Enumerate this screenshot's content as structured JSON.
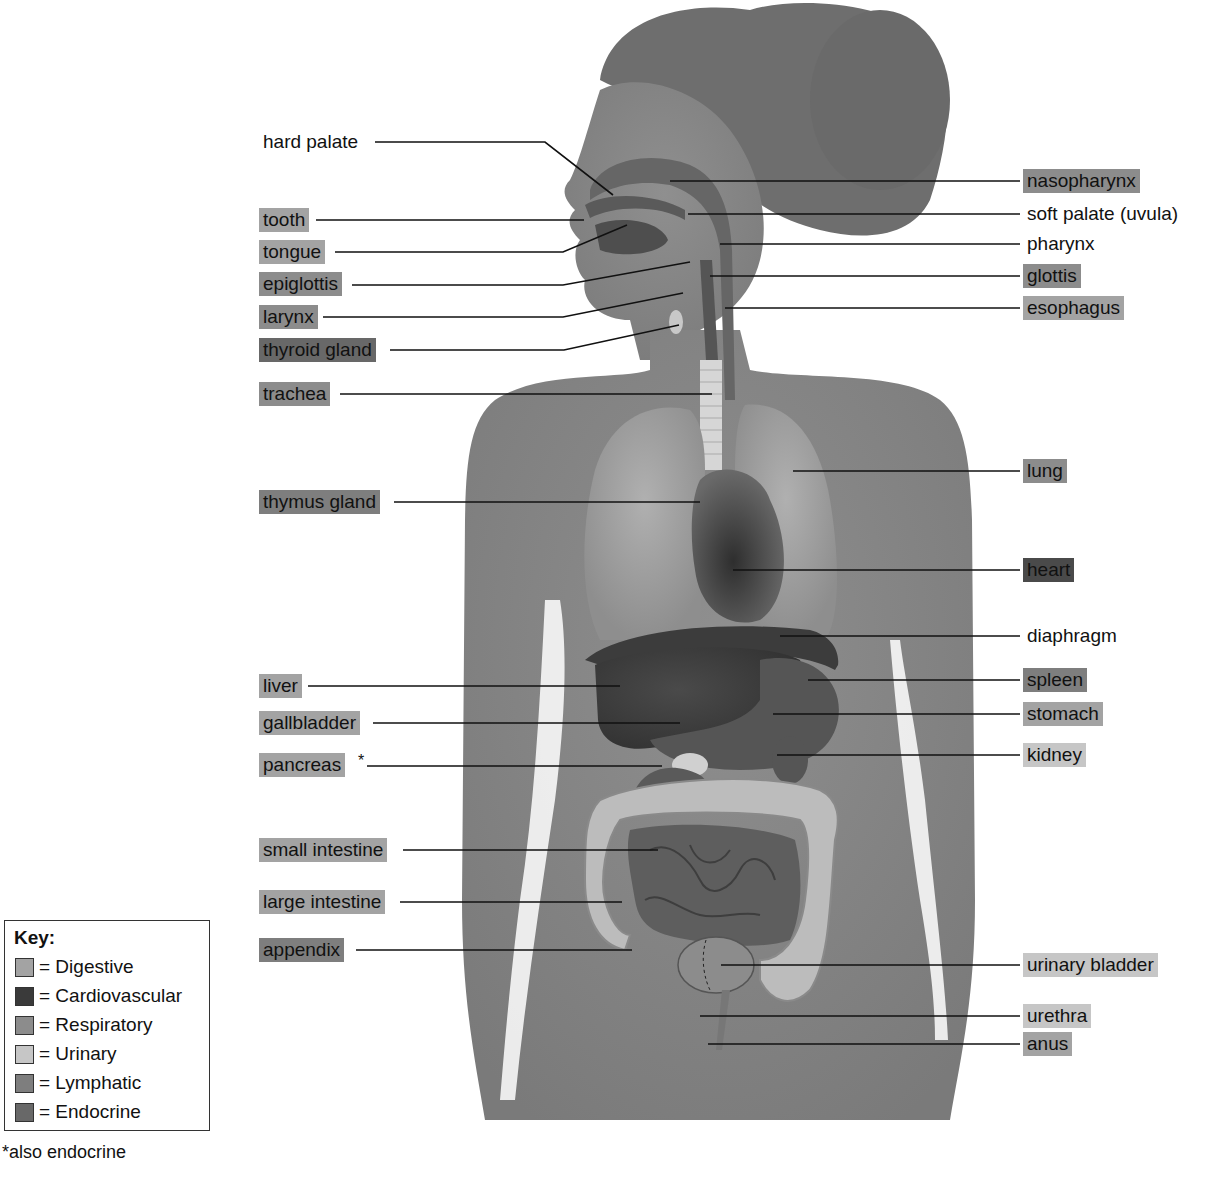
{
  "key": {
    "title": "Key:",
    "items": [
      {
        "label": "= Digestive",
        "system": "digestive",
        "color": "#a3a3a3"
      },
      {
        "label": "= Cardiovascular",
        "system": "cardiovascular",
        "color": "#3a3a3a"
      },
      {
        "label": "= Respiratory",
        "system": "respiratory",
        "color": "#8c8c8c"
      },
      {
        "label": "= Urinary",
        "system": "urinary",
        "color": "#c6c6c6"
      },
      {
        "label": "= Lymphatic",
        "system": "lymphatic",
        "color": "#7e7e7e"
      },
      {
        "label": "= Endocrine",
        "system": "endocrine",
        "color": "#686868"
      }
    ]
  },
  "footnote": "*also endocrine",
  "labels_left": [
    {
      "text": "hard palate",
      "system": "none"
    },
    {
      "text": "tooth",
      "system": "digestive"
    },
    {
      "text": "tongue",
      "system": "digestive"
    },
    {
      "text": "epiglottis",
      "system": "respiratory"
    },
    {
      "text": "larynx",
      "system": "respiratory"
    },
    {
      "text": "thyroid gland",
      "system": "endocrine"
    },
    {
      "text": "trachea",
      "system": "respiratory"
    },
    {
      "text": "thymus gland",
      "system": "lymphatic"
    },
    {
      "text": "liver",
      "system": "digestive"
    },
    {
      "text": "gallbladder",
      "system": "digestive"
    },
    {
      "text": "pancreas",
      "system": "digestive",
      "marker": "*"
    },
    {
      "text": "small intestine",
      "system": "digestive"
    },
    {
      "text": "large intestine",
      "system": "digestive"
    },
    {
      "text": "appendix",
      "system": "lymphatic"
    }
  ],
  "labels_right": [
    {
      "text": "nasopharynx",
      "system": "respiratory"
    },
    {
      "text": "soft palate (uvula)",
      "system": "none"
    },
    {
      "text": "pharynx",
      "system": "none"
    },
    {
      "text": "glottis",
      "system": "respiratory"
    },
    {
      "text": "esophagus",
      "system": "digestive"
    },
    {
      "text": "lung",
      "system": "respiratory"
    },
    {
      "text": "heart",
      "system": "cardiovascular"
    },
    {
      "text": "diaphragm",
      "system": "none"
    },
    {
      "text": "spleen",
      "system": "lymphatic"
    },
    {
      "text": "stomach",
      "system": "digestive"
    },
    {
      "text": "kidney",
      "system": "urinary"
    },
    {
      "text": "urinary bladder",
      "system": "urinary"
    },
    {
      "text": "urethra",
      "system": "urinary"
    },
    {
      "text": "anus",
      "system": "digestive"
    }
  ]
}
